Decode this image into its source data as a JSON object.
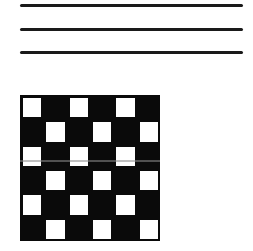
{
  "lines": {
    "count": 3,
    "y_positions": [
      4,
      28,
      51
    ],
    "color": "#1a1a1a"
  },
  "checkerboard": {
    "rows": 6,
    "cols": 6,
    "dark_color": "#0a0a0a",
    "light_color": "#ffffff",
    "pattern": [
      [
        1,
        0,
        1,
        0,
        1,
        0
      ],
      [
        0,
        1,
        0,
        1,
        0,
        1
      ],
      [
        1,
        0,
        1,
        0,
        1,
        0
      ],
      [
        0,
        1,
        0,
        1,
        0,
        1
      ],
      [
        1,
        0,
        1,
        0,
        1,
        0
      ],
      [
        0,
        1,
        0,
        1,
        0,
        1
      ]
    ]
  }
}
